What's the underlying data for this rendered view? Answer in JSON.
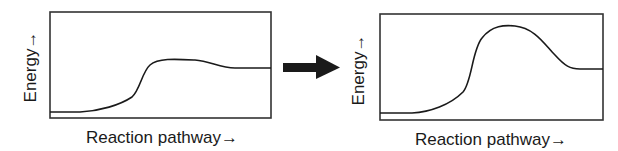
{
  "panels": [
    {
      "id": "before",
      "xlabel": "Reaction pathway→",
      "ylabel": "Energy→",
      "curve_description": "Reactant level low, rises to a small, broad hump, settles at product level",
      "box": {
        "x": 50,
        "y": 12,
        "w": 221,
        "h": 106
      },
      "path": "M50,112 L80,112 C100,111 120,105 132,97 C140,90 142,72 150,65 C158,58 175,59 195,60 C210,61 220,68 235,68 L271,68"
    },
    {
      "id": "after",
      "xlabel": "Reaction pathway→",
      "ylabel": "Energy→",
      "curve_description": "Reactant level low, rises to a tall energy peak, descends to product level",
      "box": {
        "x": 380,
        "y": 14,
        "w": 223,
        "h": 106
      },
      "path": "M380,113 L412,113 C430,112 450,105 463,92 C472,82 472,50 482,38 C492,25 505,25 515,26 C535,28 545,45 555,55 C565,66 570,69 580,69 L603,69"
    }
  ],
  "transition_arrow": {
    "direction": "right",
    "color": "#1a1a1a"
  },
  "colors": {
    "line": "#1a1a1a",
    "box": "#333333",
    "background": "#ffffff"
  }
}
